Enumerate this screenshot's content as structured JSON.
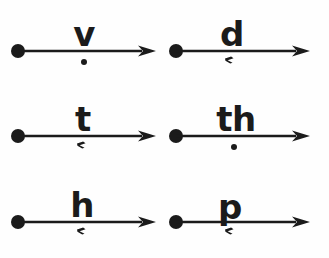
{
  "figure": {
    "background_color": "#fefefe",
    "ink_color": "#1b1b1b",
    "canvas": {
      "width": 329,
      "height": 258
    },
    "grid": {
      "columns": 2,
      "rows": 3
    }
  },
  "arrow_style": {
    "start_dot_radius": 7,
    "line_thickness": 2.6,
    "arrowhead_length": 18,
    "arrowhead_width": 11
  },
  "cells": [
    {
      "id": "cell-v",
      "label": "v",
      "diacritic": "dot",
      "diacritic_name": "dot-below",
      "column": 0,
      "row": 0,
      "left": 6,
      "top": 8,
      "line_y": 43,
      "line_start_x": 12,
      "line_end_x": 150,
      "label_x": 78,
      "diacritic_x": 78,
      "diacritic_y": 51,
      "label_crosses_line": false
    },
    {
      "id": "cell-d",
      "label": "d",
      "diacritic": "comma",
      "diacritic_name": "comma-below",
      "column": 1,
      "row": 0,
      "left": 164,
      "top": 8,
      "line_y": 43,
      "line_start_x": 12,
      "line_end_x": 146,
      "label_x": 68,
      "diacritic_x": 66,
      "diacritic_y": 47,
      "label_crosses_line": false
    },
    {
      "id": "cell-t",
      "label": "t",
      "diacritic": "comma",
      "diacritic_name": "comma-below",
      "column": 0,
      "row": 1,
      "left": 6,
      "top": 94,
      "line_y": 42,
      "line_start_x": 12,
      "line_end_x": 150,
      "label_x": 77,
      "diacritic_x": 76,
      "diacritic_y": 46,
      "label_crosses_line": false
    },
    {
      "id": "cell-th",
      "label": "th",
      "diacritic": "dot",
      "diacritic_name": "dot-below",
      "column": 1,
      "row": 1,
      "left": 164,
      "top": 94,
      "line_y": 42,
      "line_start_x": 12,
      "line_end_x": 146,
      "label_x": 72,
      "diacritic_x": 70,
      "diacritic_y": 50,
      "label_crosses_line": false
    },
    {
      "id": "cell-h",
      "label": "h",
      "diacritic": "comma",
      "diacritic_name": "comma-below",
      "column": 0,
      "row": 2,
      "left": 6,
      "top": 180,
      "line_y": 42,
      "line_start_x": 12,
      "line_end_x": 150,
      "label_x": 76,
      "diacritic_x": 76,
      "diacritic_y": 46,
      "label_crosses_line": false
    },
    {
      "id": "cell-p",
      "label": "p",
      "diacritic": "comma",
      "diacritic_name": "comma-below",
      "column": 1,
      "row": 2,
      "left": 164,
      "top": 180,
      "line_y": 42,
      "line_start_x": 12,
      "line_end_x": 146,
      "label_x": 66,
      "diacritic_x": 66,
      "diacritic_y": 46,
      "label_crosses_line": true
    }
  ]
}
